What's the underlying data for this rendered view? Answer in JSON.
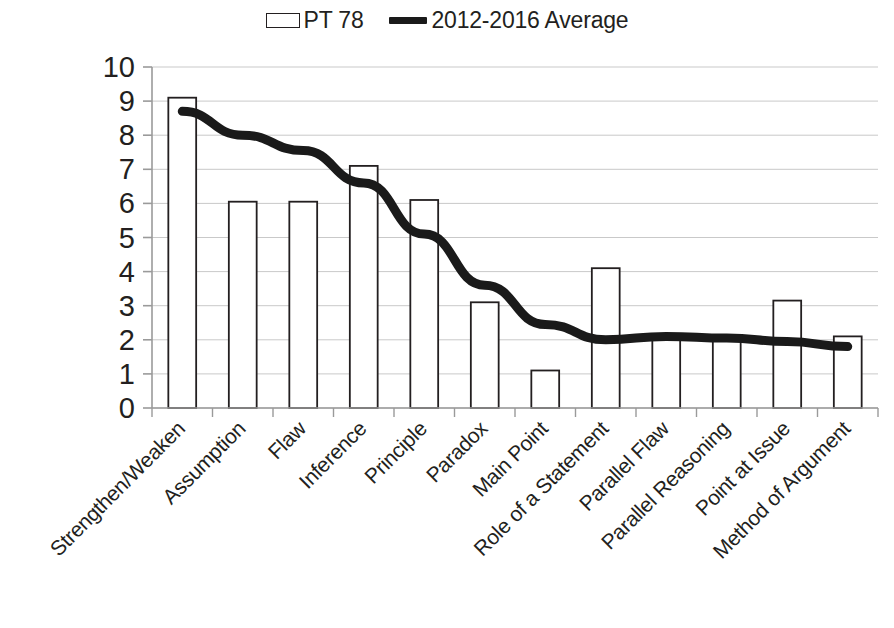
{
  "legend": {
    "items": [
      {
        "label": "PT 78",
        "marker": "bar-swatch-icon"
      },
      {
        "label": "2012-2016 Average",
        "marker": "line-swatch-icon"
      }
    ]
  },
  "axes": {
    "y_ticks": [
      "0",
      "1",
      "2",
      "3",
      "4",
      "5",
      "6",
      "7",
      "8",
      "9",
      "10"
    ],
    "y_title": "",
    "x_title": ""
  },
  "chart_data": {
    "type": "bar",
    "title": "",
    "subtitle": "",
    "xlabel": "",
    "ylabel": "",
    "ylim": [
      0,
      10
    ],
    "ytick_step": 1,
    "grid": true,
    "legend_position": "top-center",
    "categories": [
      "Strengthen/Weaken",
      "Assumption",
      "Flaw",
      "Inference",
      "Principle",
      "Paradox",
      "Main Point",
      "Role of a Statement",
      "Parallel Flaw",
      "Parallel Reasoning",
      "Point at Issue",
      "Method of Argument"
    ],
    "series": [
      {
        "name": "PT 78",
        "type": "bar",
        "color": "#ffffff",
        "edge_color": "#231f20",
        "values": [
          9.1,
          6.05,
          6.05,
          7.1,
          6.1,
          3.1,
          1.1,
          4.1,
          2.1,
          2.1,
          3.15,
          2.1
        ]
      },
      {
        "name": "2012-2016 Average",
        "type": "line",
        "color": "#1a1a1a",
        "values": [
          8.7,
          8.0,
          7.55,
          6.6,
          5.1,
          3.6,
          2.45,
          2.0,
          2.1,
          2.05,
          1.95,
          1.8
        ]
      }
    ]
  }
}
